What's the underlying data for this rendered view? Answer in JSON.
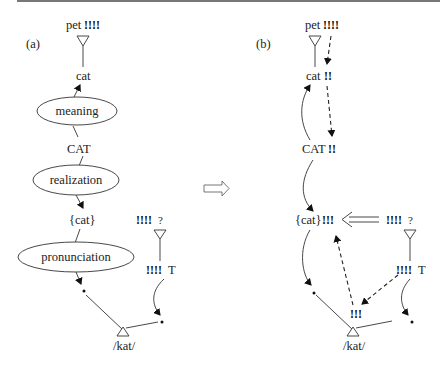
{
  "panels": {
    "a": {
      "label": "(a)",
      "pet": "pet",
      "pet_marks": "!!!!",
      "cat": "cat",
      "meaning": "meaning",
      "CAT": "CAT",
      "realization": "realization",
      "set_cat": "{cat}",
      "pronunciation": "pronunciation",
      "query_marks": "!!!!",
      "query": "?",
      "t_marks": "!!!!",
      "t": "T",
      "kat": "/kat/"
    },
    "b": {
      "label": "(b)",
      "pet": "pet",
      "pet_marks": "!!!!",
      "cat": "cat",
      "cat_marks": "!!",
      "CAT": "CAT",
      "CAT_marks": "!!",
      "set_cat": "{cat}",
      "set_cat_marks": "!!!",
      "query_marks": "!!!!",
      "query": "?",
      "t_marks": "!!!!",
      "t": "T",
      "kat_marks": "!!!",
      "kat": "/kat/"
    }
  },
  "transition_arrow": "hollow-right-arrow"
}
